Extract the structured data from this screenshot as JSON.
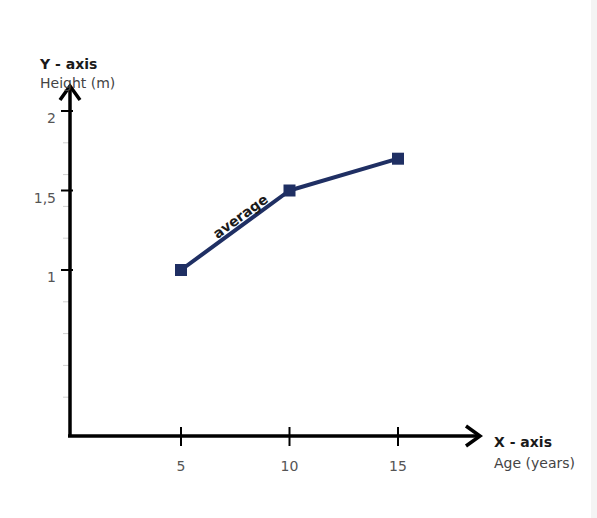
{
  "chart_data": {
    "type": "line",
    "title": "",
    "xlabel_title": "X - axis",
    "xlabel": "Age (years)",
    "ylabel_title": "Y - axis",
    "ylabel": "Height (m)",
    "x_ticks": [
      5,
      10,
      15
    ],
    "x_tick_labels": [
      "5",
      "10",
      "15"
    ],
    "y_ticks": [
      1,
      1.5,
      2
    ],
    "y_tick_labels": [
      "1",
      "1,5",
      "2"
    ],
    "y_minor_step": 0.2,
    "xlim": [
      0,
      15
    ],
    "ylim": [
      0,
      2
    ],
    "grid": false,
    "series": [
      {
        "name": "average",
        "color": "#1f2f63",
        "marker": "square",
        "x": [
          5,
          10,
          15
        ],
        "y": [
          1.0,
          1.5,
          1.7
        ]
      }
    ],
    "annotations": [
      {
        "text": "average",
        "near_series": "average",
        "between_x": [
          5,
          10
        ]
      }
    ]
  }
}
